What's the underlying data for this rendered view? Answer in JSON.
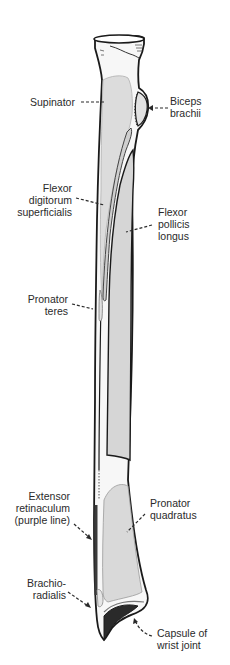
{
  "figure": {
    "colors": {
      "background": "#ffffff",
      "bone_fill": "#f7f7f7",
      "muscle_fill": "#d9d9d9",
      "muscle_fill_dark": "#c9c9c9",
      "outline": "#1a1a1a",
      "inner_line": "#9a9a9a",
      "text": "#2a2a2a"
    }
  },
  "labels": {
    "supinator": {
      "lines": [
        "Supinator"
      ]
    },
    "biceps_brachii": {
      "lines": [
        "Biceps",
        "brachii"
      ]
    },
    "flexor_digitorum_superficialis": {
      "lines": [
        "Flexor",
        "digitorum",
        "superficialis"
      ]
    },
    "flexor_pollicis_longus": {
      "lines": [
        "Flexor",
        "pollicis",
        "longus"
      ]
    },
    "pronator_teres": {
      "lines": [
        "Pronator",
        "teres"
      ]
    },
    "extensor_retinaculum": {
      "lines": [
        "Extensor",
        "retinaculum",
        "(purple line)"
      ]
    },
    "pronator_quadratus": {
      "lines": [
        "Pronator",
        "quadratus"
      ]
    },
    "brachioradialis": {
      "lines": [
        "Brachio-",
        "radialis"
      ]
    },
    "capsule_of_wrist_joint": {
      "lines": [
        "Capsule of",
        "wrist joint"
      ]
    }
  }
}
